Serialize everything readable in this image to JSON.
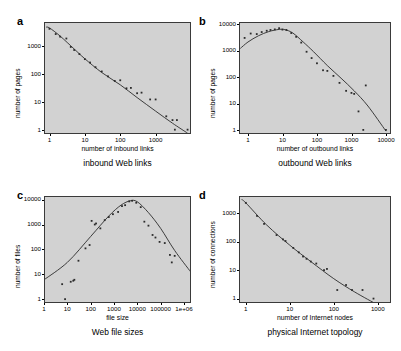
{
  "figure": {
    "background": "#ffffff",
    "plot_background": "#d2d2d2",
    "marker_color": "#2b2b2b",
    "curve_color": "#2b2b2b"
  },
  "chart_data": [
    {
      "panel": "a",
      "type": "scatter",
      "title": "inbound Web links",
      "xlabel": "number of inbound links",
      "ylabel": "number of pages",
      "xscale": "log",
      "yscale": "log",
      "xlim": [
        0.7,
        10000
      ],
      "ylim": [
        0.7,
        7000
      ],
      "xticks": [
        1,
        10,
        100,
        1000
      ],
      "xtick_labels": [
        "1",
        "10",
        "100",
        "1000"
      ],
      "yticks": [
        1,
        10,
        100,
        1000
      ],
      "ytick_labels": [
        "1",
        "10",
        "100",
        "1000"
      ],
      "grid": false,
      "legend": "none",
      "points": [
        {
          "x": 1,
          "y": 4000
        },
        {
          "x": 1.5,
          "y": 2600
        },
        {
          "x": 2,
          "y": 2100
        },
        {
          "x": 3,
          "y": 1800
        },
        {
          "x": 4,
          "y": 900
        },
        {
          "x": 5,
          "y": 700
        },
        {
          "x": 7,
          "y": 500
        },
        {
          "x": 10,
          "y": 330
        },
        {
          "x": 14,
          "y": 250
        },
        {
          "x": 20,
          "y": 170
        },
        {
          "x": 30,
          "y": 120
        },
        {
          "x": 45,
          "y": 80
        },
        {
          "x": 70,
          "y": 55
        },
        {
          "x": 100,
          "y": 58
        },
        {
          "x": 150,
          "y": 30
        },
        {
          "x": 200,
          "y": 31
        },
        {
          "x": 300,
          "y": 20
        },
        {
          "x": 400,
          "y": 21
        },
        {
          "x": 700,
          "y": 12
        },
        {
          "x": 1000,
          "y": 12
        },
        {
          "x": 2000,
          "y": 3
        },
        {
          "x": 3000,
          "y": 2.2
        },
        {
          "x": 4000,
          "y": 2.2
        },
        {
          "x": 3500,
          "y": 1
        },
        {
          "x": 8000,
          "y": 1
        }
      ],
      "fit_curve": {
        "description": "power-law decay",
        "points": [
          {
            "x": 0.8,
            "y": 4600
          },
          {
            "x": 1,
            "y": 4300
          },
          {
            "x": 2,
            "y": 2200
          },
          {
            "x": 5,
            "y": 760
          },
          {
            "x": 10,
            "y": 340
          },
          {
            "x": 30,
            "y": 110
          },
          {
            "x": 100,
            "y": 40
          },
          {
            "x": 300,
            "y": 14
          },
          {
            "x": 1000,
            "y": 4.6
          },
          {
            "x": 3000,
            "y": 1.7
          },
          {
            "x": 8000,
            "y": 0.75
          }
        ]
      }
    },
    {
      "panel": "b",
      "type": "scatter",
      "title": "outbound Web links",
      "xlabel": "number of outbound links",
      "ylabel": "number of pages",
      "xscale": "log",
      "yscale": "log",
      "xlim": [
        0.55,
        14000
      ],
      "ylim": [
        0.7,
        12000
      ],
      "xticks": [
        1,
        10,
        100,
        1000,
        10000
      ],
      "xtick_labels": [
        "1",
        "10",
        "100",
        "1000",
        "10000"
      ],
      "yticks": [
        1,
        10,
        100,
        1000,
        10000
      ],
      "ytick_labels": [
        "1",
        "10",
        "100",
        "1000",
        "10000"
      ],
      "grid": false,
      "legend": "none",
      "points": [
        {
          "x": 0.8,
          "y": 3000
        },
        {
          "x": 1.2,
          "y": 4400
        },
        {
          "x": 1.8,
          "y": 4200
        },
        {
          "x": 2.5,
          "y": 5000
        },
        {
          "x": 3.5,
          "y": 5600
        },
        {
          "x": 4.5,
          "y": 6000
        },
        {
          "x": 6,
          "y": 6300
        },
        {
          "x": 8,
          "y": 7000
        },
        {
          "x": 10,
          "y": 6200
        },
        {
          "x": 13,
          "y": 6000
        },
        {
          "x": 18,
          "y": 4600
        },
        {
          "x": 25,
          "y": 3300
        },
        {
          "x": 35,
          "y": 2000
        },
        {
          "x": 50,
          "y": 900
        },
        {
          "x": 70,
          "y": 520
        },
        {
          "x": 100,
          "y": 330
        },
        {
          "x": 150,
          "y": 180
        },
        {
          "x": 200,
          "y": 170
        },
        {
          "x": 300,
          "y": 110
        },
        {
          "x": 450,
          "y": 60
        },
        {
          "x": 700,
          "y": 30
        },
        {
          "x": 1000,
          "y": 25
        },
        {
          "x": 1200,
          "y": 23
        },
        {
          "x": 1600,
          "y": 5
        },
        {
          "x": 2200,
          "y": 1
        },
        {
          "x": 2600,
          "y": 48
        },
        {
          "x": 10000,
          "y": 1
        }
      ],
      "fit_curve": {
        "description": "log-normal shaped peak near x=10",
        "points": [
          {
            "x": 0.6,
            "y": 1200
          },
          {
            "x": 1,
            "y": 2100
          },
          {
            "x": 2,
            "y": 3600
          },
          {
            "x": 4,
            "y": 5200
          },
          {
            "x": 8,
            "y": 6300
          },
          {
            "x": 12,
            "y": 6100
          },
          {
            "x": 20,
            "y": 4600
          },
          {
            "x": 40,
            "y": 2100
          },
          {
            "x": 80,
            "y": 900
          },
          {
            "x": 200,
            "y": 270
          },
          {
            "x": 500,
            "y": 90
          },
          {
            "x": 1200,
            "y": 30
          },
          {
            "x": 3000,
            "y": 8
          },
          {
            "x": 10000,
            "y": 0.9
          }
        ]
      }
    },
    {
      "panel": "c",
      "type": "scatter",
      "title": "Web file sizes",
      "xlabel": "file size",
      "ylabel": "number of files",
      "xscale": "log",
      "yscale": "log",
      "xlim": [
        1,
        2000000
      ],
      "ylim": [
        0.7,
        14000
      ],
      "xticks": [
        1,
        10,
        100,
        1000,
        10000,
        100000,
        1000000
      ],
      "xtick_labels": [
        "1",
        "10",
        "100",
        "1000",
        "10000",
        "100000",
        "1e+06"
      ],
      "yticks": [
        1,
        10,
        100,
        1000,
        10000
      ],
      "ytick_labels": [
        "1",
        "10",
        "100",
        "1000",
        "10000"
      ],
      "grid": false,
      "legend": "none",
      "points": [
        {
          "x": 6,
          "y": 4
        },
        {
          "x": 8,
          "y": 1
        },
        {
          "x": 14,
          "y": 5
        },
        {
          "x": 18,
          "y": 5.5
        },
        {
          "x": 20,
          "y": 6
        },
        {
          "x": 30,
          "y": 35
        },
        {
          "x": 60,
          "y": 110
        },
        {
          "x": 90,
          "y": 150
        },
        {
          "x": 110,
          "y": 1400
        },
        {
          "x": 150,
          "y": 1000
        },
        {
          "x": 170,
          "y": 1100
        },
        {
          "x": 260,
          "y": 700
        },
        {
          "x": 400,
          "y": 1500
        },
        {
          "x": 600,
          "y": 2000
        },
        {
          "x": 900,
          "y": 2600
        },
        {
          "x": 1500,
          "y": 3200
        },
        {
          "x": 2200,
          "y": 5500
        },
        {
          "x": 3000,
          "y": 6000
        },
        {
          "x": 4500,
          "y": 8500
        },
        {
          "x": 6000,
          "y": 9000
        },
        {
          "x": 9000,
          "y": 7500
        },
        {
          "x": 14000,
          "y": 5000
        },
        {
          "x": 20000,
          "y": 1300
        },
        {
          "x": 30000,
          "y": 900
        },
        {
          "x": 45000,
          "y": 380
        },
        {
          "x": 60000,
          "y": 300
        },
        {
          "x": 90000,
          "y": 200
        },
        {
          "x": 150000,
          "y": 180
        },
        {
          "x": 250000,
          "y": 60
        },
        {
          "x": 400000,
          "y": 55
        },
        {
          "x": 300000,
          "y": 30
        }
      ],
      "fit_curve": {
        "description": "log-normal peak near x=5000",
        "points": [
          {
            "x": 1,
            "y": 6
          },
          {
            "x": 10,
            "y": 30
          },
          {
            "x": 100,
            "y": 330
          },
          {
            "x": 600,
            "y": 2200
          },
          {
            "x": 2000,
            "y": 6000
          },
          {
            "x": 5000,
            "y": 9000
          },
          {
            "x": 10000,
            "y": 8200
          },
          {
            "x": 30000,
            "y": 3000
          },
          {
            "x": 100000,
            "y": 700
          },
          {
            "x": 400000,
            "y": 90
          },
          {
            "x": 2000000,
            "y": 12
          }
        ]
      }
    },
    {
      "panel": "d",
      "type": "scatter",
      "title": "physical Internet topology",
      "xlabel": "number of Internet nodes",
      "ylabel": "number of connections",
      "xscale": "log",
      "yscale": "log",
      "xlim": [
        0.7,
        2000
      ],
      "ylim": [
        0.7,
        4000
      ],
      "xticks": [
        1,
        10,
        100,
        1000
      ],
      "xtick_labels": [
        "1",
        "10",
        "100",
        "1000"
      ],
      "yticks": [
        1,
        10,
        100,
        1000
      ],
      "ytick_labels": [
        "1",
        "10",
        "100",
        "1000"
      ],
      "grid": false,
      "legend": "none",
      "points": [
        {
          "x": 1,
          "y": 2300
        },
        {
          "x": 1.8,
          "y": 800
        },
        {
          "x": 2.6,
          "y": 420
        },
        {
          "x": 5,
          "y": 170
        },
        {
          "x": 7,
          "y": 120
        },
        {
          "x": 8,
          "y": 105
        },
        {
          "x": 12,
          "y": 60
        },
        {
          "x": 16,
          "y": 42
        },
        {
          "x": 20,
          "y": 30
        },
        {
          "x": 24,
          "y": 25
        },
        {
          "x": 30,
          "y": 20
        },
        {
          "x": 40,
          "y": 17
        },
        {
          "x": 60,
          "y": 10
        },
        {
          "x": 70,
          "y": 11
        },
        {
          "x": 120,
          "y": 2
        },
        {
          "x": 190,
          "y": 3
        },
        {
          "x": 260,
          "y": 2
        },
        {
          "x": 450,
          "y": 2
        },
        {
          "x": 800,
          "y": 1
        }
      ],
      "fit_curve": {
        "description": "power-law decay",
        "points": [
          {
            "x": 0.8,
            "y": 3000
          },
          {
            "x": 1,
            "y": 2300
          },
          {
            "x": 3,
            "y": 380
          },
          {
            "x": 10,
            "y": 75
          },
          {
            "x": 30,
            "y": 20
          },
          {
            "x": 100,
            "y": 5
          },
          {
            "x": 300,
            "y": 1.7
          },
          {
            "x": 1000,
            "y": 0.6
          }
        ]
      }
    }
  ]
}
